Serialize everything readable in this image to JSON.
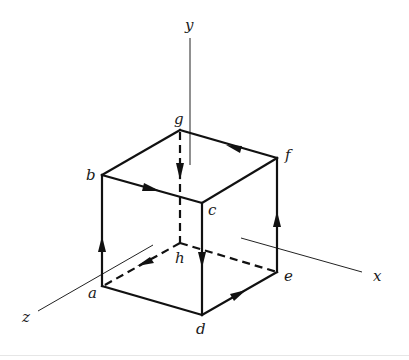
{
  "figure": {
    "axes": {
      "x": {
        "label": "x"
      },
      "y": {
        "label": "y"
      },
      "z": {
        "label": "z"
      }
    },
    "vertices": {
      "a": {
        "label": "a"
      },
      "b": {
        "label": "b"
      },
      "c": {
        "label": "c"
      },
      "d": {
        "label": "d"
      },
      "e": {
        "label": "e"
      },
      "f": {
        "label": "f"
      },
      "g": {
        "label": "g"
      },
      "h": {
        "label": "h"
      }
    },
    "path_order": [
      "a",
      "b",
      "c",
      "d",
      "e",
      "f",
      "g",
      "h",
      "a"
    ],
    "hidden_edges": [
      "g-h",
      "h-a",
      "h-e"
    ],
    "colors": {
      "line": "#111111",
      "background": "#ffffff"
    }
  }
}
